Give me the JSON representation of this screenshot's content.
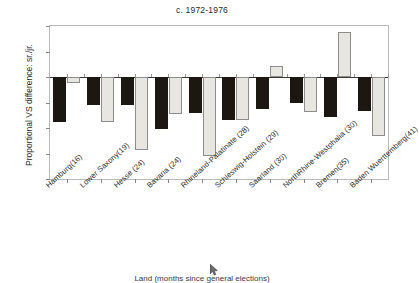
{
  "chart_data": {
    "type": "bar",
    "title": "c. 1972-1976",
    "xlabel": "Land (months since general elections)",
    "ylabel": "Proportional VS difference: sr./jr.",
    "ylim": [
      -40,
      20
    ],
    "yticks": [
      20,
      10,
      0,
      -10,
      -20,
      -30,
      -40
    ],
    "ytick_labels": [
      "20",
      "10",
      "0",
      "-10",
      "-20",
      "-30",
      "-40"
    ],
    "grid": false,
    "legend": "none",
    "categories": [
      "Hamburg(16)",
      "Lower Saxony(19)",
      "Hesse (24)",
      "Bavaria (24)",
      "Rhineland-Palatinate (28)",
      "Schleswig-Holstein (29)",
      "Saarland (30)",
      "NorthRhine-Westphalia (30)",
      "Bremen(35)",
      "Baden Wuerttemberg(41)"
    ],
    "series": [
      {
        "name": "senior",
        "color": "#1d1712",
        "values": [
          -17.5,
          -10.8,
          -11.0,
          -20.5,
          -14.0,
          -17.0,
          -12.5,
          -10.0,
          -15.8,
          -13.5
        ]
      },
      {
        "name": "junior",
        "color": "#e8e6e0",
        "values": [
          -2.5,
          -17.8,
          -28.5,
          -14.5,
          -31.0,
          -17.0,
          4.5,
          -13.8,
          17.8,
          -23.0
        ]
      }
    ]
  }
}
